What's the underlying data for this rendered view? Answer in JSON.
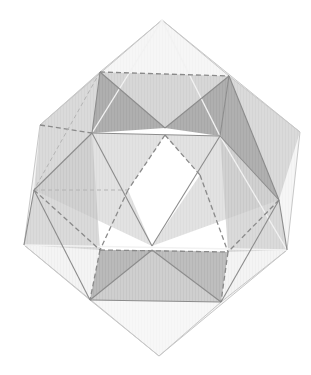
{
  "figure": {
    "colors": {
      "background": "#ffffff",
      "face_light": "#e6e6e6",
      "face_mid": "#c4c4c4",
      "face_dark": "#9e9e9e",
      "edge": "#8c8c8c",
      "edge_light": "#c8c8c8"
    },
    "vertices": {
      "top_apex": [
        162,
        20
      ],
      "bottom_apex": [
        159,
        356
      ],
      "outer_left_upper": [
        40,
        125
      ],
      "outer_left_lower": [
        24,
        245
      ],
      "outer_right_upper": [
        300,
        132
      ],
      "outer_right_lower": [
        287,
        250
      ],
      "upper_square_left": [
        100,
        72
      ],
      "upper_square_right": [
        229,
        76
      ],
      "upper_v": [
        165,
        128
      ],
      "mid_left": [
        92,
        133
      ],
      "mid_right": [
        220,
        136
      ],
      "left_vertex": [
        34,
        190
      ],
      "right_vertex": [
        279,
        200
      ],
      "lower_left": [
        100,
        250
      ],
      "lower_right": [
        228,
        252
      ],
      "lower_center": [
        152,
        250
      ],
      "lower_square_left": [
        90,
        300
      ],
      "lower_square_right": [
        221,
        302
      ],
      "window_top": [
        165,
        135
      ],
      "window_bottom": [
        152,
        246
      ]
    }
  }
}
